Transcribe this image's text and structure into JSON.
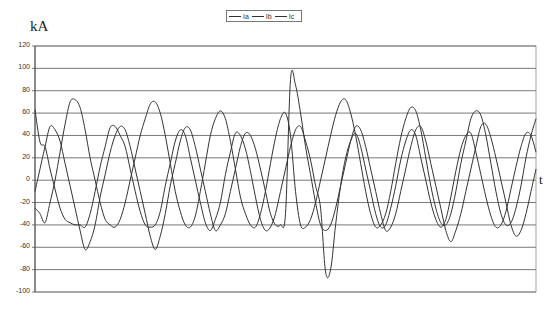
{
  "chart_data": {
    "type": "line",
    "title": "",
    "ylabel": "kA",
    "xlabel": "t",
    "ylim": [
      -100,
      120
    ],
    "yticks": [
      120,
      100,
      80,
      60,
      40,
      20,
      0,
      -20,
      -40,
      -60,
      -80,
      -100
    ],
    "grid": true,
    "legend_position": "top-center",
    "legend": [
      "Ia",
      "Ib",
      "Ic"
    ],
    "x": [
      0,
      1,
      2,
      3,
      4,
      5,
      6,
      7,
      8,
      9,
      10,
      11,
      12,
      13,
      14,
      15,
      16,
      17,
      18,
      19,
      20,
      21,
      22,
      23,
      24,
      25,
      26,
      27,
      28,
      29,
      30,
      31,
      32,
      33,
      34,
      35,
      36,
      37,
      38,
      39,
      40,
      41,
      42,
      43,
      44,
      45,
      46,
      47,
      48,
      49,
      50,
      51,
      52,
      53,
      54,
      55,
      56,
      57,
      58,
      59,
      60,
      61,
      62,
      63,
      64,
      65,
      66,
      67,
      68,
      69,
      70,
      71,
      72,
      73,
      74,
      75,
      76,
      77,
      78,
      79,
      80,
      81,
      82,
      83,
      84,
      85,
      86,
      87,
      88,
      89,
      90,
      91,
      92,
      93,
      94,
      95,
      96,
      97,
      98,
      99,
      100
    ],
    "series": [
      {
        "name": "Ia",
        "values": [
          63,
          34,
          30,
          10,
          -8,
          -25,
          -35,
          -38,
          -40,
          -40,
          -42,
          -30,
          -10,
          12,
          30,
          47,
          48,
          40,
          30,
          10,
          -10,
          -28,
          -40,
          -42,
          -40,
          -28,
          -5,
          15,
          35,
          45,
          40,
          20,
          0,
          -20,
          -38,
          -45,
          -35,
          -20,
          5,
          25,
          42,
          40,
          28,
          8,
          -15,
          -35,
          -45,
          -42,
          -30,
          -10,
          10,
          30,
          45,
          48,
          35,
          18,
          -5,
          -25,
          -82,
          -80,
          -40,
          -5,
          20,
          35,
          42,
          30,
          10,
          -10,
          -30,
          -42,
          -40,
          -25,
          -5,
          18,
          35,
          45,
          40,
          20,
          0,
          -20,
          -35,
          -42,
          -35,
          -15,
          8,
          28,
          40,
          42,
          25,
          5,
          -15,
          -32,
          -42,
          -40,
          -28,
          -8,
          12,
          30,
          42,
          40,
          25
        ]
      },
      {
        "name": "Ib",
        "values": [
          -10,
          10,
          30,
          48,
          45,
          35,
          15,
          -5,
          -25,
          -45,
          -62,
          -55,
          -40,
          -15,
          5,
          25,
          40,
          48,
          45,
          30,
          10,
          -10,
          -30,
          -50,
          -62,
          -50,
          -30,
          -5,
          15,
          35,
          47,
          45,
          30,
          10,
          -10,
          -30,
          -45,
          -40,
          -30,
          -10,
          10,
          30,
          42,
          40,
          28,
          10,
          -10,
          -30,
          -40,
          -40,
          -30,
          90,
          85,
          60,
          30,
          5,
          -20,
          -40,
          -45,
          -40,
          -25,
          -5,
          15,
          35,
          48,
          45,
          30,
          10,
          -10,
          -30,
          -45,
          -42,
          -30,
          -10,
          10,
          30,
          45,
          48,
          35,
          15,
          -5,
          -25,
          -45,
          -55,
          -45,
          -30,
          -10,
          10,
          30,
          48,
          50,
          38,
          20,
          0,
          -20,
          -40,
          -50,
          -45,
          -30,
          -10,
          10
        ]
      },
      {
        "name": "Ic",
        "values": [
          -25,
          -30,
          -38,
          -20,
          0,
          25,
          50,
          70,
          72,
          65,
          45,
          20,
          0,
          -20,
          -35,
          -40,
          -42,
          -35,
          -20,
          0,
          20,
          40,
          55,
          68,
          70,
          60,
          40,
          15,
          -10,
          -28,
          -40,
          -42,
          -32,
          -10,
          15,
          40,
          55,
          62,
          55,
          35,
          10,
          -15,
          -30,
          -40,
          -42,
          -30,
          -10,
          15,
          38,
          55,
          60,
          40,
          -10,
          -40,
          -42,
          -35,
          -20,
          0,
          20,
          40,
          58,
          70,
          72,
          60,
          40,
          15,
          -10,
          -30,
          -42,
          -40,
          -30,
          -10,
          15,
          38,
          55,
          65,
          62,
          45,
          20,
          -5,
          -25,
          -38,
          -40,
          -30,
          -10,
          15,
          35,
          55,
          62,
          58,
          40,
          15,
          -10,
          -30,
          -40,
          -38,
          -25,
          -5,
          20,
          40,
          55
        ]
      }
    ]
  },
  "labels": {
    "unit": "kA",
    "time_axis": "t",
    "legend": [
      "Ia",
      "Ib",
      "Ic"
    ]
  }
}
